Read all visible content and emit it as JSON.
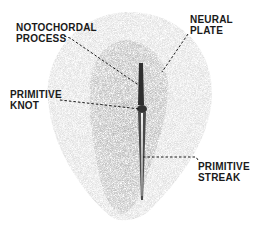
{
  "diagram": {
    "labels": {
      "notochordal_process": {
        "line1": "NOTOCHORDAL",
        "line2": "PROCESS"
      },
      "neural_plate": {
        "line1": "NEURAL",
        "line2": "PLATE"
      },
      "primitive_knot": {
        "line1": "PRIMITIVE",
        "line2": "KNOT"
      },
      "primitive_streak": {
        "line1": "PRIMITIVE",
        "line2": "STREAK"
      }
    },
    "colors": {
      "background": "#ffffff",
      "disc_outer": "#d4d4d4",
      "disc_inner": "#b4b4b4",
      "structure": "#3a3a3a",
      "ink": "#1a1a1a"
    }
  }
}
